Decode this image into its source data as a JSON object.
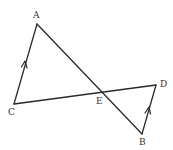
{
  "diagram": {
    "points": {
      "A": {
        "label": "A",
        "x": 37,
        "y": 24,
        "lx": 36,
        "ly": 18
      },
      "B": {
        "label": "B",
        "x": 142,
        "y": 134,
        "lx": 142,
        "ly": 145
      },
      "C": {
        "label": "C",
        "x": 14,
        "y": 104,
        "lx": 11,
        "ly": 115
      },
      "D": {
        "label": "D",
        "x": 156,
        "y": 85,
        "lx": 163,
        "ly": 84
      },
      "E": {
        "label": "E",
        "x": 102,
        "y": 93,
        "lx": 99,
        "ly": 104
      }
    },
    "segments": [
      "AB",
      "CD",
      "AC",
      "BD"
    ],
    "parallel_marks": [
      "AC",
      "BD"
    ],
    "line_color": "#2a2a2a"
  }
}
